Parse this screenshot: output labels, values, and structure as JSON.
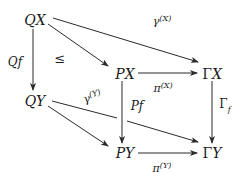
{
  "diagram": {
    "type": "commutative-diagram",
    "nodes": {
      "QX": {
        "label": "QX",
        "x": 35,
        "y": 20
      },
      "PX": {
        "label": "PX",
        "x": 124,
        "y": 73
      },
      "GX": {
        "label": "ΓX",
        "x": 212,
        "y": 73
      },
      "QY": {
        "label": "QY",
        "x": 35,
        "y": 100
      },
      "PY": {
        "label": "PY",
        "x": 124,
        "y": 153
      },
      "GY": {
        "label": "ΓY",
        "x": 212,
        "y": 153
      }
    },
    "edges": [
      {
        "from": "QX",
        "to": "GX",
        "label": "γ",
        "sup": "(X)"
      },
      {
        "from": "QX",
        "to": "PX",
        "label": "",
        "sup": ""
      },
      {
        "from": "QX",
        "to": "QY",
        "label": "Qf",
        "sup": ""
      },
      {
        "from": "PX",
        "to": "GX",
        "label": "π",
        "sup": "(X)"
      },
      {
        "from": "PX",
        "to": "PY",
        "label": "Pf",
        "sup": ""
      },
      {
        "from": "GX",
        "to": "GY",
        "label": "Γ",
        "sub": "f"
      },
      {
        "from": "QY",
        "to": "GY",
        "label": "γ",
        "sup": "(Y)"
      },
      {
        "from": "QY",
        "to": "PY",
        "label": "",
        "sup": ""
      },
      {
        "from": "PY",
        "to": "GY",
        "label": "π",
        "sup": "(Y)"
      }
    ],
    "annotations": {
      "leq": "≤"
    }
  },
  "labels": {
    "gammaX": {
      "base": "γ",
      "sup": "(X)"
    },
    "gammaY": {
      "base": "γ",
      "sup": "(Y)"
    },
    "piX": {
      "base": "π",
      "sup": "(X)"
    },
    "piY": {
      "base": "π",
      "sup": "(Y)"
    },
    "Qf": "Qf",
    "Pf": "Pf",
    "Gammaf": {
      "base": "Γ",
      "sub": "f"
    },
    "leq": "≤"
  }
}
